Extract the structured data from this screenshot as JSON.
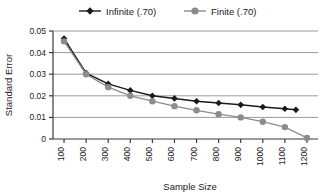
{
  "chart_data": {
    "type": "line",
    "title": "",
    "xlabel": "Sample Size",
    "ylabel": "Standard Error",
    "xlim": [
      50,
      1250
    ],
    "ylim": [
      0,
      0.05
    ],
    "grid": true,
    "legend_position": "top",
    "x": [
      100,
      200,
      300,
      400,
      500,
      600,
      700,
      800,
      900,
      1000,
      1100,
      1150,
      1200
    ],
    "xticks": [
      "100",
      "200",
      "300",
      "400",
      "500",
      "600",
      "700",
      "800",
      "900",
      "1000",
      "1100",
      "1200"
    ],
    "xtick_values": [
      100,
      200,
      300,
      400,
      500,
      600,
      700,
      800,
      900,
      1000,
      1100,
      1200
    ],
    "yticks": [
      "0",
      "0.01",
      "0.02",
      "0.03",
      "0.04",
      "0.05"
    ],
    "ytick_values": [
      0,
      0.01,
      0.02,
      0.03,
      0.04,
      0.05
    ],
    "series": [
      {
        "name": "Infinite (.70)",
        "marker": "diamond",
        "color": "#1a1a1a",
        "x": [
          100,
          200,
          300,
          400,
          500,
          600,
          700,
          800,
          900,
          1000,
          1100,
          1150
        ],
        "values": [
          0.0465,
          0.0305,
          0.0255,
          0.0225,
          0.02,
          0.0188,
          0.0175,
          0.0167,
          0.0158,
          0.0148,
          0.014,
          0.0135
        ]
      },
      {
        "name": "Finite (.70)",
        "marker": "circle",
        "color": "#8c8c8c",
        "x": [
          100,
          200,
          300,
          400,
          500,
          600,
          700,
          800,
          900,
          1000,
          1100,
          1200
        ],
        "values": [
          0.0452,
          0.03,
          0.024,
          0.02,
          0.0175,
          0.0152,
          0.0133,
          0.0115,
          0.01,
          0.008,
          0.0055,
          0.0005
        ]
      }
    ]
  },
  "legend": {
    "items": [
      {
        "label": "Infinite (.70)",
        "marker": "diamond-marker",
        "color": "#1a1a1a"
      },
      {
        "label": "Finite (.70)",
        "marker": "circle-marker",
        "color": "#8c8c8c"
      }
    ]
  },
  "axes": {
    "y_title": "Standard Error",
    "x_title": "Sample Size"
  },
  "colors": {
    "infinite": "#1a1a1a",
    "finite": "#8c8c8c",
    "gridline": "#9a9a9a",
    "axis": "#3a3a3a",
    "background": "#ffffff"
  }
}
